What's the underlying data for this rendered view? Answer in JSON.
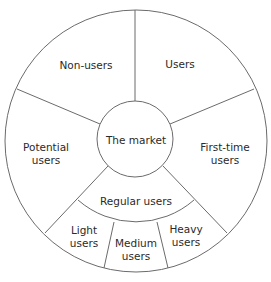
{
  "diagram": {
    "type": "segmented-circle",
    "center_label": "The market",
    "outer_segments": [
      {
        "id": "non-users",
        "label": "Non-users"
      },
      {
        "id": "users",
        "label": "Users"
      },
      {
        "id": "potential-users",
        "label": "Potential users",
        "lines": [
          "Potential",
          "users"
        ]
      },
      {
        "id": "first-time-users",
        "label": "First-time users",
        "lines": [
          "First-time",
          "users"
        ]
      },
      {
        "id": "regular-users",
        "label": "Regular users"
      }
    ],
    "sub_segments": [
      {
        "id": "light-users",
        "label": "Light users",
        "lines": [
          "Light",
          "users"
        ]
      },
      {
        "id": "medium-users",
        "label": "Medium users",
        "lines": [
          "Medium",
          "users"
        ]
      },
      {
        "id": "heavy-users",
        "label": "Heavy users",
        "lines": [
          "Heavy",
          "users"
        ]
      }
    ],
    "colors": {
      "stroke": "#6b6b6b",
      "text": "#2a2a2a",
      "background": "#ffffff"
    }
  }
}
